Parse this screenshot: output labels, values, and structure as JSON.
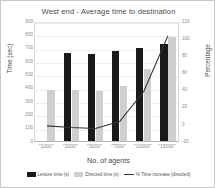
{
  "chart_data": {
    "type": "bar",
    "title": "West end - Average time to destination",
    "xlabel": "No. of agents",
    "ylabel": "Time (sec)",
    "y2label": "Percentage",
    "categories": [
      "\"1000\"",
      "\"2000\"",
      "\"3000\"",
      "\"7000\"",
      "\"10000\"",
      "\"15000\""
    ],
    "ylim": [
      0,
      900
    ],
    "y2lim": [
      -20,
      120
    ],
    "yticks": [
      900,
      800,
      700,
      600,
      500,
      400,
      300,
      200,
      100,
      0
    ],
    "y2ticks": [
      120,
      100,
      80,
      60,
      40,
      20,
      0,
      -20
    ],
    "grid": true,
    "legend_position": "bottom",
    "series": [
      {
        "name": "Leisure time (s)",
        "type": "bar",
        "color": "#1a1a1a",
        "axis": "left",
        "values": [
          0,
          660,
          650,
          675,
          700,
          730
        ]
      },
      {
        "name": "Directed time (s)",
        "type": "bar",
        "color": "#cfcfcf",
        "axis": "left",
        "values": [
          380,
          380,
          375,
          415,
          540,
          780
        ]
      },
      {
        "name": "% Time increase (directed)",
        "type": "line",
        "color": "#333333",
        "axis": "right",
        "values": [
          0,
          -2,
          -3,
          5,
          40,
          105
        ]
      }
    ]
  }
}
